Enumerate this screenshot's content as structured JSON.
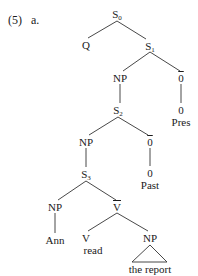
{
  "example": {
    "number": "(5)",
    "sub": "a."
  },
  "tree": {
    "nodes": [
      {
        "id": "S0",
        "base": "S",
        "sub": "0",
        "x": 117,
        "y": 9
      },
      {
        "id": "Q",
        "base": "Q",
        "sub": "",
        "x": 86,
        "y": 40
      },
      {
        "id": "S1",
        "base": "S",
        "sub": "1",
        "x": 150,
        "y": 41
      },
      {
        "id": "NP1",
        "base": "NP",
        "sub": "",
        "x": 120,
        "y": 73
      },
      {
        "id": "Obar1",
        "base": "0",
        "sub": "",
        "overline": true,
        "x": 181,
        "y": 73
      },
      {
        "id": "S2",
        "base": "S",
        "sub": "2",
        "x": 118,
        "y": 105
      },
      {
        "id": "Zero1",
        "base": "0",
        "sub": "",
        "x": 181,
        "y": 105
      },
      {
        "id": "Pres",
        "base": "Pres",
        "sub": "",
        "x": 181,
        "y": 117
      },
      {
        "id": "NP2",
        "base": "NP",
        "sub": "",
        "x": 86,
        "y": 137
      },
      {
        "id": "Obar2",
        "base": "0",
        "sub": "",
        "overline": true,
        "x": 150,
        "y": 137
      },
      {
        "id": "S3",
        "base": "S",
        "sub": "3",
        "x": 86,
        "y": 169
      },
      {
        "id": "Zero2",
        "base": "0",
        "sub": "",
        "x": 150,
        "y": 168
      },
      {
        "id": "Past",
        "base": "Past",
        "sub": "",
        "x": 150,
        "y": 180
      },
      {
        "id": "NP3",
        "base": "NP",
        "sub": "",
        "x": 55,
        "y": 202
      },
      {
        "id": "Vbar",
        "base": "V",
        "sub": "",
        "overline": true,
        "x": 117,
        "y": 202
      },
      {
        "id": "Ann",
        "base": "Ann",
        "sub": "",
        "x": 55,
        "y": 235
      },
      {
        "id": "V",
        "base": "V",
        "sub": "",
        "x": 86,
        "y": 233
      },
      {
        "id": "read",
        "base": "read",
        "sub": "",
        "x": 93,
        "y": 245
      },
      {
        "id": "NP4",
        "base": "NP",
        "sub": "",
        "x": 150,
        "y": 233
      },
      {
        "id": "report",
        "base": "the report",
        "sub": "",
        "x": 150,
        "y": 264
      }
    ],
    "edges": [
      [
        117,
        21,
        88,
        38
      ],
      [
        117,
        21,
        146,
        39
      ],
      [
        150,
        52,
        123,
        71
      ],
      [
        150,
        52,
        180,
        71
      ],
      [
        120,
        84,
        120,
        103
      ],
      [
        181,
        84,
        181,
        103
      ],
      [
        118,
        117,
        89,
        135
      ],
      [
        118,
        117,
        148,
        135
      ],
      [
        86,
        148,
        86,
        167
      ],
      [
        150,
        148,
        150,
        166
      ],
      [
        86,
        181,
        58,
        200
      ],
      [
        86,
        181,
        116,
        200
      ],
      [
        55,
        213,
        55,
        233
      ],
      [
        117,
        213,
        88,
        231
      ],
      [
        117,
        213,
        148,
        231
      ]
    ],
    "triangle": {
      "apex": [
        150,
        245
      ],
      "left": [
        132,
        262
      ],
      "right": [
        167,
        262
      ]
    }
  }
}
